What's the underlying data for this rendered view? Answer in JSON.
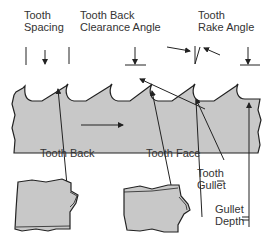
{
  "diagram": {
    "labels": {
      "tooth_spacing": [
        "Tooth",
        "Spacing"
      ],
      "tooth_back_clearance_angle": [
        "Tooth Back",
        "Clearance Angle"
      ],
      "tooth_rake_angle": [
        "Tooth",
        "Rake Angle"
      ],
      "tooth_back": "Tooth Back",
      "tooth_face": "Tooth Face",
      "tooth_gullet": [
        "Tooth",
        "Gullet"
      ],
      "gullet_depth": [
        "Gullet",
        "Depth"
      ]
    },
    "colors": {
      "blade_fill": "#c8c8c8",
      "line": "#222222",
      "text": "#333333"
    },
    "annotations": {
      "direction_arrow": "cutting direction (right)"
    }
  }
}
